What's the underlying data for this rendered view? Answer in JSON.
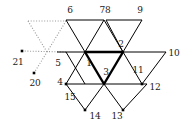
{
  "figure": {
    "background_color": "#ffffff",
    "stroke_color": "#000000",
    "dotted_color": "#999999",
    "bold_color": "#000000",
    "width": 189,
    "height": 126
  },
  "labels": [
    {
      "id": "label-6",
      "text": "6",
      "x": 70,
      "y": 10
    },
    {
      "id": "label-78",
      "text": "78",
      "x": 105,
      "y": 10
    },
    {
      "id": "label-9",
      "text": "9",
      "x": 140,
      "y": 10
    },
    {
      "id": "label-2",
      "text": "2",
      "x": 121,
      "y": 44
    },
    {
      "id": "label-10",
      "text": "10",
      "x": 174,
      "y": 53
    },
    {
      "id": "label-1",
      "text": "1",
      "x": 89,
      "y": 63
    },
    {
      "id": "label-3",
      "text": "3",
      "x": 106,
      "y": 72
    },
    {
      "id": "label-11",
      "text": "11",
      "x": 138,
      "y": 70
    },
    {
      "id": "label-5",
      "text": "5",
      "x": 58,
      "y": 63
    },
    {
      "id": "label-21",
      "text": "21",
      "x": 18,
      "y": 62
    },
    {
      "id": "label-20",
      "text": "20",
      "x": 35,
      "y": 83
    },
    {
      "id": "label-4",
      "text": "4",
      "x": 60,
      "y": 82
    },
    {
      "id": "label-15",
      "text": "15",
      "x": 70,
      "y": 97
    },
    {
      "id": "label-12",
      "text": "12",
      "x": 155,
      "y": 87
    },
    {
      "id": "label-14",
      "text": "14",
      "x": 95,
      "y": 116
    },
    {
      "id": "label-13",
      "text": "13",
      "x": 117,
      "y": 116
    }
  ],
  "nodes": [
    {
      "id": "node-21",
      "x": 22,
      "y": 51,
      "marker": "square"
    },
    {
      "id": "node-20",
      "x": 34,
      "y": 73,
      "marker": "square"
    },
    {
      "id": "node-5",
      "x": 66,
      "y": 52,
      "marker": "none"
    },
    {
      "id": "node-1",
      "x": 85,
      "y": 52,
      "marker": "vertex"
    },
    {
      "id": "node-2",
      "x": 123,
      "y": 52,
      "marker": "vertex"
    },
    {
      "id": "node-3",
      "x": 104,
      "y": 84,
      "marker": "vertex"
    },
    {
      "id": "node-4",
      "x": 66,
      "y": 84,
      "marker": "square"
    },
    {
      "id": "node-11",
      "x": 142,
      "y": 84,
      "marker": "square"
    },
    {
      "id": "node-12",
      "x": 147,
      "y": 84,
      "marker": "none"
    },
    {
      "id": "node-14",
      "x": 85,
      "y": 110,
      "marker": "square"
    },
    {
      "id": "node-13",
      "x": 123,
      "y": 110,
      "marker": "square"
    }
  ],
  "solid_edges": [
    {
      "id": "edge-top-left-bar",
      "x1": 66,
      "y1": 20,
      "x2": 104,
      "y2": 20
    },
    {
      "id": "edge-top-right-bar",
      "x1": 106,
      "y1": 20,
      "x2": 142,
      "y2": 20
    },
    {
      "id": "edge-mid-bar",
      "x1": 57,
      "y1": 52,
      "x2": 166,
      "y2": 52
    },
    {
      "id": "edge-6-left",
      "x1": 66,
      "y1": 20,
      "x2": 85,
      "y2": 52
    },
    {
      "id": "edge-6-right",
      "x1": 104,
      "y1": 20,
      "x2": 85,
      "y2": 52
    },
    {
      "id": "edge-78-up",
      "x1": 104,
      "y1": 20,
      "x2": 123,
      "y2": 52
    },
    {
      "id": "edge-9-left",
      "x1": 106,
      "y1": 20,
      "x2": 123,
      "y2": 52
    },
    {
      "id": "edge-9-right",
      "x1": 142,
      "y1": 20,
      "x2": 123,
      "y2": 52
    },
    {
      "id": "edge-10-down",
      "x1": 166,
      "y1": 52,
      "x2": 142,
      "y2": 84
    },
    {
      "id": "edge-11-left",
      "x1": 123,
      "y1": 52,
      "x2": 142,
      "y2": 84
    },
    {
      "id": "edge-5-down",
      "x1": 66,
      "y1": 52,
      "x2": 85,
      "y2": 84
    },
    {
      "id": "edge-4-up",
      "x1": 66,
      "y1": 84,
      "x2": 85,
      "y2": 52
    },
    {
      "id": "edge-low-bar",
      "x1": 66,
      "y1": 84,
      "x2": 147,
      "y2": 84
    },
    {
      "id": "edge-15-down",
      "x1": 66,
      "y1": 84,
      "x2": 85,
      "y2": 110
    },
    {
      "id": "edge-14-right",
      "x1": 85,
      "y1": 110,
      "x2": 104,
      "y2": 84
    },
    {
      "id": "edge-13-left",
      "x1": 104,
      "y1": 84,
      "x2": 123,
      "y2": 110
    },
    {
      "id": "edge-13-right",
      "x1": 123,
      "y1": 110,
      "x2": 147,
      "y2": 84
    }
  ],
  "bold_edges": [
    {
      "id": "bold-1-2",
      "x1": 85,
      "y1": 52,
      "x2": 123,
      "y2": 52
    },
    {
      "id": "bold-1-3",
      "x1": 85,
      "y1": 52,
      "x2": 104,
      "y2": 84
    },
    {
      "id": "bold-2-3",
      "x1": 123,
      "y1": 52,
      "x2": 104,
      "y2": 84
    }
  ],
  "dotted_edges": [
    {
      "id": "dotted-top",
      "x1": 28,
      "y1": 21,
      "x2": 66,
      "y2": 21
    },
    {
      "id": "dotted-left",
      "x1": 28,
      "y1": 21,
      "x2": 47,
      "y2": 52
    },
    {
      "id": "dotted-right",
      "x1": 66,
      "y1": 21,
      "x2": 47,
      "y2": 52
    },
    {
      "id": "dotted-21-5",
      "x1": 22,
      "y1": 51,
      "x2": 66,
      "y2": 52
    },
    {
      "id": "dotted-20-up",
      "x1": 34,
      "y1": 73,
      "x2": 47,
      "y2": 52
    }
  ]
}
